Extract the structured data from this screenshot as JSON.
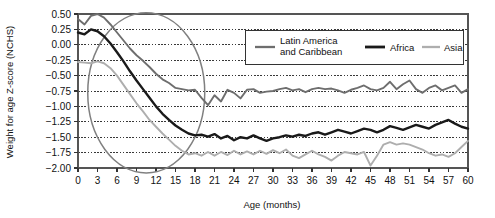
{
  "chart_data": {
    "type": "line",
    "title": "",
    "xlabel": "Age (months)",
    "ylabel": "Weight for age Z-score (NCHS)",
    "xlim": [
      0,
      60
    ],
    "ylim": [
      -2.0,
      0.5
    ],
    "xticks": [
      0,
      3,
      6,
      9,
      12,
      15,
      18,
      21,
      24,
      27,
      30,
      33,
      36,
      39,
      42,
      45,
      48,
      51,
      54,
      57,
      60
    ],
    "xtick_labels": [
      "0",
      "3",
      "6",
      "9",
      "12",
      "15",
      "18",
      "21",
      "24",
      "27",
      "30",
      "33",
      "36",
      "39",
      "42",
      "45",
      "48",
      "51",
      "54",
      "57",
      "60"
    ],
    "yticks": [
      0.5,
      0.25,
      0.0,
      -0.25,
      -0.5,
      -0.75,
      -1.0,
      -1.25,
      -1.5,
      -1.75,
      -2.0
    ],
    "ytick_labels": [
      "0.50",
      "0.25",
      "0.00",
      "-0.25",
      "-0.50",
      "-0.75",
      "-1.00",
      "-1.25",
      "-1.50",
      "-1.75",
      "-2.00"
    ],
    "grid": true,
    "grid_style": "dotted-horizontal",
    "legend_position": "top-right",
    "x": [
      0,
      1,
      2,
      3,
      4,
      5,
      6,
      7,
      8,
      9,
      10,
      11,
      12,
      13,
      14,
      15,
      16,
      17,
      18,
      19,
      20,
      21,
      22,
      23,
      24,
      25,
      26,
      27,
      28,
      29,
      30,
      31,
      32,
      33,
      34,
      35,
      36,
      37,
      38,
      39,
      40,
      41,
      42,
      43,
      44,
      45,
      46,
      47,
      48,
      49,
      50,
      51,
      52,
      53,
      54,
      55,
      56,
      57,
      58,
      59,
      60
    ],
    "series": [
      {
        "name": "Latin America and Caribbean",
        "color": "#6e6e6e",
        "width": 1.9,
        "values": [
          0.42,
          0.33,
          0.47,
          0.5,
          0.44,
          0.33,
          0.2,
          0.07,
          -0.06,
          -0.17,
          -0.26,
          -0.36,
          -0.47,
          -0.56,
          -0.62,
          -0.7,
          -0.72,
          -0.74,
          -0.73,
          -0.86,
          -0.98,
          -0.82,
          -0.92,
          -0.73,
          -0.78,
          -0.87,
          -0.73,
          -0.72,
          -0.78,
          -0.76,
          -0.75,
          -0.72,
          -0.7,
          -0.74,
          -0.72,
          -0.77,
          -0.72,
          -0.7,
          -0.72,
          -0.71,
          -0.74,
          -0.78,
          -0.73,
          -0.7,
          -0.66,
          -0.72,
          -0.74,
          -0.7,
          -0.6,
          -0.72,
          -0.64,
          -0.58,
          -0.72,
          -0.78,
          -0.7,
          -0.66,
          -0.74,
          -0.7,
          -0.66,
          -0.78,
          -0.72
        ]
      },
      {
        "name": "Africa",
        "color": "#1a1a1a",
        "width": 2.4,
        "values": [
          0.2,
          0.17,
          0.25,
          0.22,
          0.14,
          0.02,
          -0.12,
          -0.27,
          -0.43,
          -0.58,
          -0.72,
          -0.86,
          -1.0,
          -1.12,
          -1.22,
          -1.31,
          -1.38,
          -1.44,
          -1.47,
          -1.46,
          -1.49,
          -1.45,
          -1.52,
          -1.48,
          -1.55,
          -1.5,
          -1.52,
          -1.47,
          -1.52,
          -1.56,
          -1.52,
          -1.5,
          -1.47,
          -1.49,
          -1.46,
          -1.48,
          -1.44,
          -1.42,
          -1.46,
          -1.42,
          -1.38,
          -1.41,
          -1.44,
          -1.4,
          -1.36,
          -1.38,
          -1.42,
          -1.38,
          -1.32,
          -1.35,
          -1.38,
          -1.34,
          -1.3,
          -1.33,
          -1.36,
          -1.3,
          -1.26,
          -1.22,
          -1.28,
          -1.33,
          -1.36
        ]
      },
      {
        "name": "Asia",
        "color": "#aeaeae",
        "width": 1.9,
        "values": [
          -0.28,
          -0.29,
          -0.3,
          -0.27,
          -0.3,
          -0.38,
          -0.5,
          -0.65,
          -0.8,
          -0.95,
          -1.08,
          -1.22,
          -1.33,
          -1.44,
          -1.54,
          -1.64,
          -1.72,
          -1.78,
          -1.76,
          -1.8,
          -1.74,
          -1.8,
          -1.74,
          -1.79,
          -1.72,
          -1.78,
          -1.73,
          -1.78,
          -1.72,
          -1.77,
          -1.71,
          -1.76,
          -1.7,
          -1.8,
          -1.84,
          -1.78,
          -1.72,
          -1.78,
          -1.82,
          -1.88,
          -1.8,
          -1.74,
          -1.76,
          -1.78,
          -1.74,
          -1.96,
          -1.8,
          -1.62,
          -1.58,
          -1.62,
          -1.6,
          -1.62,
          -1.66,
          -1.7,
          -1.76,
          -1.8,
          -1.78,
          -1.82,
          -1.76,
          -1.66,
          -1.56
        ]
      }
    ],
    "annotations": [
      {
        "type": "ellipse",
        "name": "highlight-ellipse",
        "color": "#808080",
        "x_center": 10.5,
        "y_center": -0.78,
        "x_radius": 9.0,
        "y_radius": 1.3
      }
    ]
  },
  "legend": {
    "entries": [
      {
        "label_line1": "Latin America",
        "label_line2": "and Caribbean"
      },
      {
        "label_line1": "Africa",
        "label_line2": ""
      },
      {
        "label_line1": "Asia",
        "label_line2": ""
      }
    ]
  }
}
